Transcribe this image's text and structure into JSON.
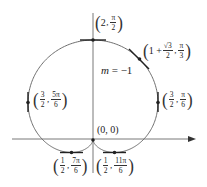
{
  "figure": {
    "type": "polar-curve-diagram",
    "curve": "r = 1 + sin θ (cardioid)",
    "colors": {
      "curve": "#6e6e6e",
      "axis": "#555555",
      "tangent": "#222222",
      "point": "#222222",
      "text": "#222222"
    }
  },
  "labels": {
    "top": {
      "r": "2",
      "theta_num": "π",
      "theta_den": "2"
    },
    "upper_right": {
      "r_int": "1 +",
      "r_num": "√3",
      "r_den": "2",
      "theta_num": "π",
      "theta_den": "3"
    },
    "right": {
      "r_num": "3",
      "r_den": "2",
      "theta_num": "π",
      "theta_den": "6"
    },
    "left": {
      "r_num": "3",
      "r_den": "2",
      "theta_num": "5π",
      "theta_den": "6"
    },
    "origin": "(0, 0)",
    "bottom_left": {
      "r_num": "1",
      "r_den": "2",
      "theta_num": "7π",
      "theta_den": "6"
    },
    "bottom_right": {
      "r_num": "1",
      "r_den": "2",
      "theta_num": "11π",
      "theta_den": "6"
    },
    "slope": {
      "var": "m",
      "eq": " = −1"
    }
  },
  "points": [
    {
      "name": "top",
      "r": 2,
      "theta": "π/2",
      "tangent": "horizontal"
    },
    {
      "name": "upper_right",
      "r": "1+√3/2",
      "theta": "π/3",
      "tangent_slope": -1
    },
    {
      "name": "right",
      "r": 1.5,
      "theta": "π/6",
      "tangent": "vertical"
    },
    {
      "name": "left",
      "r": 1.5,
      "theta": "5π/6",
      "tangent": "vertical"
    },
    {
      "name": "origin",
      "r": 0,
      "theta": "3π/2"
    },
    {
      "name": "bottom_left",
      "r": 0.5,
      "theta": "7π/6",
      "tangent": "horizontal"
    },
    {
      "name": "bottom_right",
      "r": 0.5,
      "theta": "11π/6",
      "tangent": "horizontal"
    }
  ]
}
